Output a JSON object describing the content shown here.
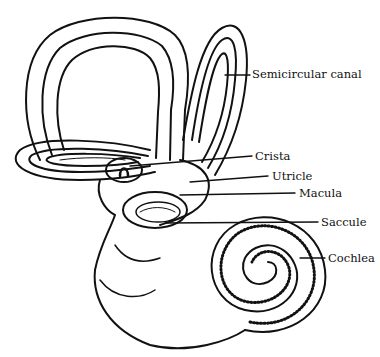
{
  "diagram": {
    "labels": [
      {
        "id": "semicircular-canal",
        "text": "Semicircular canal",
        "x": 252,
        "y": 70
      },
      {
        "id": "crista",
        "text": "Crista",
        "x": 255,
        "y": 152
      },
      {
        "id": "utricle",
        "text": "Utricle",
        "x": 272,
        "y": 172
      },
      {
        "id": "macula",
        "text": "Macula",
        "x": 299,
        "y": 189
      },
      {
        "id": "saccule",
        "text": "Saccule",
        "x": 321,
        "y": 218
      },
      {
        "id": "cochlea",
        "text": "Cochlea",
        "x": 328,
        "y": 252
      }
    ],
    "colors": {
      "ink": "#111111",
      "background": "#ffffff"
    }
  }
}
